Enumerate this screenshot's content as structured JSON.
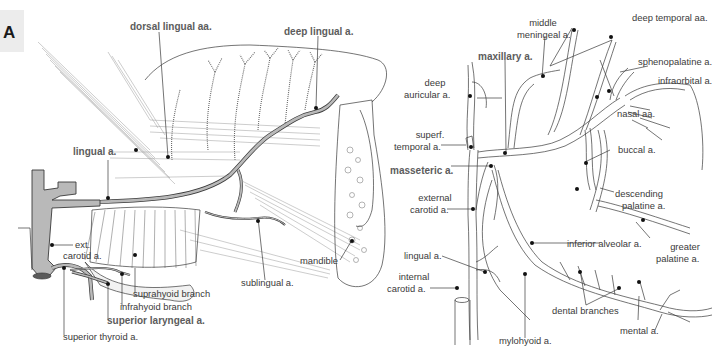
{
  "figure": {
    "panel_letter": "A",
    "left_panel": {
      "subject": "tongue and floor of mouth, lateral view",
      "labels": {
        "dorsal_lingual": "dorsal lingual aa.",
        "deep_lingual": "deep lingual a.",
        "lingual": "lingual a.",
        "ext_carotid_1": "ext.",
        "ext_carotid_2": "carotid a.",
        "suprahyoid": "suprahyoid branch",
        "infrahyoid": "infrahyoid branch",
        "superior_laryngeal": "superior laryngeal a.",
        "superior_thyroid": "superior thyroid a.",
        "sublingual": "sublingual a.",
        "mandible": "mandible"
      }
    },
    "right_panel": {
      "subject": "maxillary artery branches",
      "labels": {
        "middle_meningeal_1": "middle",
        "middle_meningeal_2": "meningeal a.",
        "deep_temporal": "deep temporal aa.",
        "maxillary": "maxillary a.",
        "sphenopalatine": "sphenopalatine a.",
        "infraorbital": "infraorbital a.",
        "deep_auricular_1": "deep",
        "deep_auricular_2": "auricular a.",
        "nasal": "nasal aa.",
        "superf_temporal_1": "superf.",
        "superf_temporal_2": "temporal a.",
        "buccal": "buccal a.",
        "masseteric": "masseteric a.",
        "external_carotid_1": "external",
        "external_carotid_2": "carotid a.",
        "descending_palatine_1": "descending",
        "descending_palatine_2": "palatine a.",
        "inferior_alveolar": "inferior alveolar a.",
        "greater_palatine_1": "greater",
        "greater_palatine_2": "palatine a.",
        "lingual": "lingual a.",
        "internal_carotid_1": "internal",
        "internal_carotid_2": "carotid a.",
        "dental_branches": "dental branches",
        "mental": "mental a.",
        "mylohyoid": "mylohyoid a."
      }
    },
    "colors": {
      "vessel_fill": "#b9b9b9",
      "outline": "#3a3a3a",
      "label_text": "#3a3a3a",
      "bold_label_text": "#5c5c5c",
      "panel_letter_bg": "#ececec"
    }
  }
}
